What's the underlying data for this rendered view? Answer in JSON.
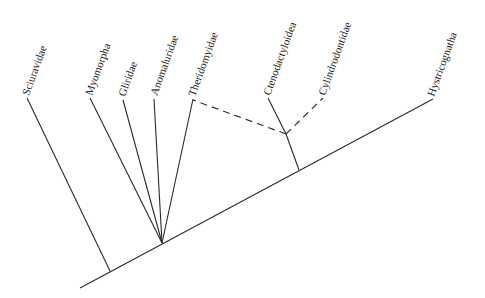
{
  "diagram": {
    "type": "cladogram",
    "taxa": [
      {
        "id": "sciuravidae",
        "label": "Sciuravidae",
        "tip": [
          27,
          98
        ]
      },
      {
        "id": "myomorpha",
        "label": "Myomorpha",
        "tip": [
          90,
          98
        ]
      },
      {
        "id": "gliridae",
        "label": "Gliridae",
        "tip": [
          123,
          100
        ]
      },
      {
        "id": "anomaluridae",
        "label": "Anomaluridae",
        "tip": [
          154,
          99
        ]
      },
      {
        "id": "theridomyidae",
        "label": "Theridomyidae",
        "tip": [
          193,
          99
        ]
      },
      {
        "id": "ctenodactyloidea",
        "label": "Ctenodactyloidea",
        "tip": [
          268,
          98
        ]
      },
      {
        "id": "cylindrodontidae",
        "label": "Cylindrodontidae",
        "tip": [
          323,
          98
        ]
      },
      {
        "id": "hystricognatha",
        "label": "Hystricognatha",
        "tip": [
          433,
          99
        ]
      }
    ],
    "nodes": {
      "root": [
        80,
        288
      ],
      "sciuravidae_node": [
        110,
        270
      ],
      "polytomy_node": [
        162,
        242
      ],
      "ctenodactyl_base_node": [
        299,
        170
      ],
      "ctenodactyl_inner_node": [
        286,
        134
      ]
    },
    "relationships": {
      "solid": [
        "root -> hystricognatha",
        "sciuravidae_node -> sciuravidae",
        "polytomy_node -> myomorpha",
        "polytomy_node -> gliridae",
        "polytomy_node -> anomaluridae",
        "polytomy_node -> theridomyidae",
        "ctenodactyl_base_node -> ctenodactyl_inner_node -> ctenodactyloidea"
      ],
      "dashed": [
        "ctenodactyl_inner_node -> theridomyidae",
        "ctenodactyl_inner_node -> cylindrodontidae"
      ]
    }
  }
}
